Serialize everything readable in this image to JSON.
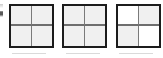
{
  "canvas": {
    "width": 163,
    "height": 58,
    "background_color": "#ffffff"
  },
  "figure": {
    "square_count": 3,
    "border_color": "#1c1c1c",
    "inner_line_color": "#6e6e6e",
    "fill_light_color": "#f0f0f0",
    "fill_white_color": "#ffffff"
  },
  "squares": [
    {
      "index": 1,
      "label": "square-1",
      "rows": 2,
      "cols": 2,
      "cells": [
        {
          "row": 0,
          "col": 0,
          "fill": "light"
        },
        {
          "row": 0,
          "col": 1,
          "fill": "light"
        },
        {
          "row": 1,
          "col": 0,
          "fill": "light"
        },
        {
          "row": 1,
          "col": 1,
          "fill": "light"
        }
      ]
    },
    {
      "index": 2,
      "label": "square-2",
      "rows": 2,
      "cols": 2,
      "cells": [
        {
          "row": 0,
          "col": 0,
          "fill": "light"
        },
        {
          "row": 0,
          "col": 1,
          "fill": "light"
        },
        {
          "row": 1,
          "col": 0,
          "fill": "light"
        },
        {
          "row": 1,
          "col": 1,
          "fill": "light"
        }
      ]
    },
    {
      "index": 3,
      "label": "square-3",
      "rows": 2,
      "cols": 2,
      "cells": [
        {
          "row": 0,
          "col": 0,
          "fill": "white"
        },
        {
          "row": 0,
          "col": 1,
          "fill": "light"
        },
        {
          "row": 1,
          "col": 0,
          "fill": "light"
        },
        {
          "row": 1,
          "col": 1,
          "fill": "white"
        }
      ]
    }
  ],
  "artifacts": {
    "corner_speck": "small dark speck at left edge",
    "baseline_smudges": 3
  }
}
